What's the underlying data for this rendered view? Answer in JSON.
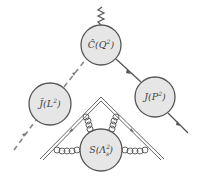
{
  "diagram": {
    "type": "feynman-factorization",
    "nodes": [
      {
        "id": "hard",
        "label": "Ĉ(Q²)",
        "base": "Ĉ(Q",
        "sup": "2",
        "close": ")",
        "cx": 101,
        "cy": 45,
        "r": 20
      },
      {
        "id": "jet-left",
        "label": "J̄(L²)",
        "base": "J̄(L",
        "sup": "2",
        "close": ")",
        "cx": 50,
        "cy": 104,
        "r": 21
      },
      {
        "id": "jet-right",
        "label": "J(P²)",
        "base": "J(P",
        "sup": "2",
        "close": ")",
        "cx": 155,
        "cy": 97,
        "r": 20
      },
      {
        "id": "soft",
        "label": "S(Λ²_s)",
        "base": "S(Λ",
        "sup": "2",
        "sub": "s",
        "close": ")",
        "cx": 101,
        "cy": 150,
        "r": 21
      }
    ],
    "colors": {
      "node_fill": "#e6e6e6",
      "stroke": "#555555",
      "background": "#ffffff"
    }
  }
}
